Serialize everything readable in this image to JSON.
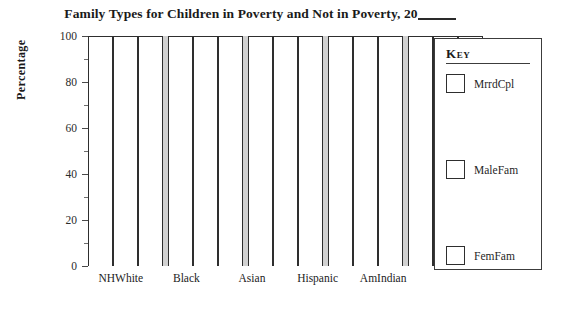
{
  "chart_data": {
    "type": "bar",
    "title": "Family Types for Children in Poverty and Not in Poverty, 20",
    "title_blank_suffix": "____",
    "xlabel": "",
    "ylabel": "Percentage",
    "ylim": [
      0,
      100
    ],
    "yticks": [
      0,
      20,
      40,
      60,
      80,
      100
    ],
    "ytick_labels": [
      "0",
      "20",
      "40",
      "60",
      "80",
      "100"
    ],
    "minor_tick_interval": 10,
    "grid": false,
    "legend_position": "right",
    "bar_style": "empty-outline",
    "bar_fill_color": "#ffffff",
    "bar_edge_color": "#2e2e2e",
    "group_separator_color": "#d2d2d2",
    "note": "blank worksheet chart; all bar outlines drawn full height",
    "categories": [
      "NHWhite",
      "Black",
      "Asian",
      "Hispanic",
      "AmIndian"
    ],
    "series": [
      {
        "name": "MrrdCpl",
        "values": [
          100,
          100,
          100,
          100,
          100
        ]
      },
      {
        "name": "MaleFam",
        "values": [
          100,
          100,
          100,
          100,
          100
        ]
      },
      {
        "name": "FemFam",
        "values": [
          100,
          100,
          100,
          100,
          100
        ]
      }
    ]
  },
  "legend": {
    "title": "Key",
    "entries": [
      {
        "label": "MrrdCpl"
      },
      {
        "label": "MaleFam"
      },
      {
        "label": "FemFam"
      }
    ]
  }
}
